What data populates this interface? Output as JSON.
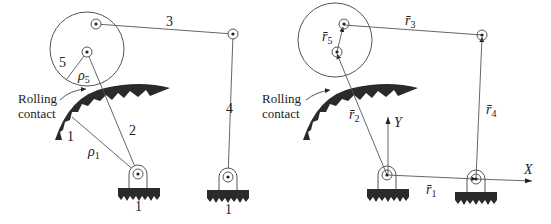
{
  "left_diagram": {
    "name": "four-bar mechanism with rolling contact (physical)",
    "link_labels": {
      "link3": "3",
      "link4": "4",
      "link5": "5",
      "link2": "2",
      "link1_arc": "1",
      "ground_left": "1",
      "ground_right": "1"
    },
    "radius_labels": {
      "rho5": {
        "sym": "ρ",
        "sub": "5"
      },
      "rho1": {
        "sym": "ρ",
        "sub": "1"
      }
    },
    "contact_label_line1": "Rolling",
    "contact_label_line2": "contact"
  },
  "right_diagram": {
    "name": "vector loop representation",
    "vectors": {
      "r1": {
        "sym": "r̄",
        "sub": "1"
      },
      "r2": {
        "sym": "r̄",
        "sub": "2"
      },
      "r3": {
        "sym": "r̄",
        "sub": "3"
      },
      "r4": {
        "sym": "r̄",
        "sub": "4"
      },
      "r5": {
        "sym": "r̄",
        "sub": "5"
      }
    },
    "axes": {
      "x": "X",
      "y": "Y"
    },
    "contact_label_line1": "Rolling",
    "contact_label_line2": "contact"
  },
  "colors": {
    "line": "#555555",
    "fill": "#2a2a2a",
    "text": "#222222"
  }
}
